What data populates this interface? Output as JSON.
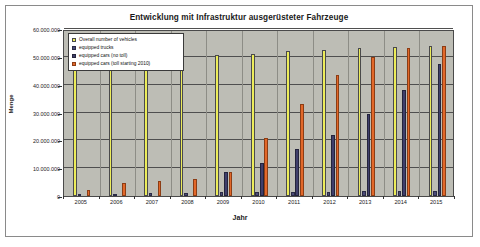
{
  "chart_data": {
    "type": "bar",
    "title": "Entwicklung mit Infrastruktur ausgerüsteter Fahrzeuge",
    "xlabel": "Jahr",
    "ylabel": "Menge",
    "categories": [
      "2005",
      "2006",
      "2007",
      "2008",
      "2009",
      "2010",
      "2011",
      "2012",
      "2013",
      "2014",
      "2015"
    ],
    "ylim": [
      0,
      60000000
    ],
    "ytick_labels": [
      "0",
      "10.000.000",
      "20.000.000",
      "30.000.000",
      "40.000.000",
      "50.000.000",
      "60.000.000"
    ],
    "ytick_values": [
      0,
      10000000,
      20000000,
      30000000,
      40000000,
      50000000,
      60000000
    ],
    "grid": true,
    "legend_position": "top-left",
    "series": [
      {
        "name": "Overall number of vehicles",
        "color": "#ecec5a",
        "values": [
          54000000,
          54000000,
          54500000,
          50000000,
          50500000,
          51000000,
          52000000,
          52500000,
          53000000,
          53500000,
          54000000
        ]
      },
      {
        "name": "equipped trucks",
        "color": "#4b4b78",
        "values": [
          600000,
          900000,
          1000000,
          1200000,
          1300000,
          1400000,
          1500000,
          1600000,
          1700000,
          1800000,
          1900000
        ]
      },
      {
        "name": "equipped cars (no toll)",
        "color": "#3f3f6b",
        "values": [
          0,
          0,
          0,
          0,
          8500000,
          12000000,
          17000000,
          22000000,
          29500000,
          38000000,
          47500000
        ]
      },
      {
        "name": "equipped cars (toll starting 2010)",
        "color": "#e2682a",
        "values": [
          2200000,
          4500000,
          5500000,
          6000000,
          8800000,
          21000000,
          33000000,
          43500000,
          50000000,
          53000000,
          54000000
        ]
      }
    ]
  }
}
